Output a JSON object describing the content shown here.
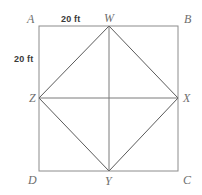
{
  "figure": {
    "colors": {
      "outer_square_stroke": "#8c8c8c",
      "inner_rhombus_stroke": "#5a5a5a",
      "median_line_stroke": "#7a7a7a",
      "vertex_label_color": "#6e6e6e",
      "dimension_label_color": "#3a3a3a",
      "background": "#ffffff"
    },
    "outer_square": {
      "name": "ABCD",
      "corners": [
        {
          "label": "A",
          "position": "top-left",
          "x": 39,
          "y": 26
        },
        {
          "label": "B",
          "position": "top-right",
          "x": 178,
          "y": 26
        },
        {
          "label": "C",
          "position": "bottom-right",
          "x": 178,
          "y": 171
        },
        {
          "label": "D",
          "position": "bottom-left",
          "x": 39,
          "y": 171
        }
      ]
    },
    "inner_rhombus": {
      "name": "WXYZ",
      "vertices": [
        {
          "label": "W",
          "position": "top-midpoint",
          "x": 109,
          "y": 26
        },
        {
          "label": "X",
          "position": "right-midpoint",
          "x": 178,
          "y": 98
        },
        {
          "label": "Y",
          "position": "bottom-midpoint",
          "x": 109,
          "y": 171
        },
        {
          "label": "Z",
          "position": "left-midpoint",
          "x": 39,
          "y": 98
        }
      ]
    },
    "median_lines": [
      {
        "name": "vertical-median",
        "from": "W",
        "to": "Y"
      },
      {
        "name": "horizontal-median",
        "from": "Z",
        "to": "X"
      }
    ],
    "dimensions": [
      {
        "name": "top-edge-length",
        "value": "20 ft",
        "edge": "A to W"
      },
      {
        "name": "left-edge-length",
        "value": "20 ft",
        "edge": "A to Z"
      }
    ]
  }
}
